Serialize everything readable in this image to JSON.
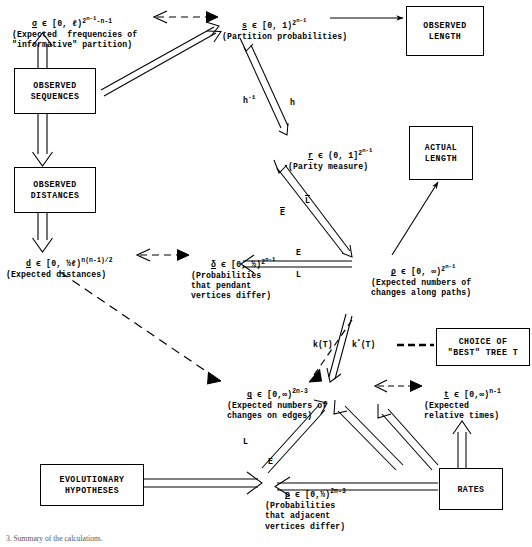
{
  "diagram": {
    "title": "Summary of the calculations",
    "caption": "3. Summary of the calculations."
  },
  "nodes": {
    "sigma": {
      "symbol": "σ",
      "domain_pre": " ϵ [0, ℓ)",
      "exponent_base": "2",
      "exponent_sup": "n-1",
      "exponent_tail": "-n-1",
      "desc_line1": "(Expected  frequencies of",
      "desc_line2": "\"informative\" partition)"
    },
    "s": {
      "symbol": "s",
      "domain_pre": " ϵ [0, 1)",
      "exponent_base": "2",
      "exponent_sup": "n-1",
      "desc_line1": "(Partition probabilities)"
    },
    "r": {
      "symbol": "r",
      "domain_pre": " ϵ (0, 1]",
      "exponent_base": "2",
      "exponent_sup": "n-1",
      "desc_line1": "(Parity measure)"
    },
    "d": {
      "symbol": "d",
      "domain_pre": " ϵ [0, ½ℓ)",
      "exponent_base": "n(n-1)/2",
      "desc_line1": "(Expected distances)"
    },
    "delta": {
      "symbol": "δ",
      "domain_pre": " ϵ [0, ½)",
      "exponent_base": "2",
      "exponent_sup": "n-1",
      "desc_line1": "(Probabilities",
      "desc_line2": "that pendant",
      "desc_line3": "vertices differ)"
    },
    "rho": {
      "symbol": "ρ",
      "domain_pre": " ϵ [0, ∞)",
      "exponent_base": "2",
      "exponent_sup": "n-1",
      "desc_line1": "(Expected numbers of",
      "desc_line2": "changes along paths)"
    },
    "q": {
      "symbol": "q",
      "domain_pre": " ϵ [0,∞)",
      "exponent_base": "2n-3",
      "desc_line1": "(Expected numbers of",
      "desc_line2": "changes on edges)"
    },
    "t": {
      "symbol": "t",
      "domain_pre": " ϵ [0,∞)",
      "exponent_base": "n-1",
      "desc_line1": "(Expected",
      "desc_line2": "relative times)"
    },
    "p": {
      "symbol": "p",
      "domain_pre": " ϵ [0,½)",
      "exponent_base": "2n-3",
      "desc_line1": "(Probabilities",
      "desc_line2": "that adjacent",
      "desc_line3": "vertices differ)"
    }
  },
  "boxes": {
    "observed_sequences": {
      "line1": "OBSERVED",
      "line2": "SEQUENCES"
    },
    "observed_distances": {
      "line1": "OBSERVED",
      "line2": "DISTANCES"
    },
    "observed_length": {
      "line1": "OBSERVED",
      "line2": "LENGTH"
    },
    "actual_length": {
      "line1": "ACTUAL",
      "line2": "LENGTH"
    },
    "choice_of_best_tree": {
      "line1": "CHOICE OF",
      "line2": "\"BEST\" TREE T"
    },
    "evolutionary_hypotheses": {
      "line1": "EVOLUTIONARY",
      "line2": "HYPOTHESES"
    },
    "rates": {
      "line1": "RATES",
      "line2": ""
    }
  },
  "edge_labels": {
    "h_inverse": "h",
    "h_inverse_sup": "-1",
    "h": "h",
    "E_bar": "E",
    "L_bar": "L",
    "E_rho": "E",
    "L_rho": "L",
    "k_T": "k(T)",
    "k_star_T": "k",
    "k_star_sup": "*",
    "k_star_tail": "(T)",
    "L_p": "L",
    "E_p": "E"
  },
  "colors": {
    "ink": "#000000",
    "paper": "#ffffff"
  }
}
